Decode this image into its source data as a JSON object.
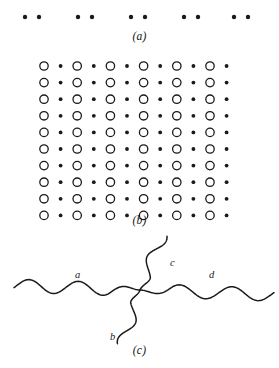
{
  "figure": {
    "width": 279,
    "height": 368,
    "background": "#ffffff",
    "ink_color": "#1a1a1a"
  },
  "panels": [
    {
      "id": "a",
      "caption": "(a)",
      "description": "row of dot pairs",
      "dot_color": "#1a1a1a",
      "dot_radius": 2.2,
      "baseline_y": 17,
      "pair_gap": 14,
      "pairs_x": [
        32,
        85,
        138,
        191,
        241
      ]
    },
    {
      "id": "b",
      "caption": "(b)",
      "description": "two-dimensional alternating lattice of open circles and filled dots",
      "rows": 10,
      "columns": 12,
      "open_circle_radius": 4.2,
      "open_circle_stroke": 1.3,
      "filled_dot_radius": 1.9,
      "origin_x": 44,
      "origin_y": 16,
      "step_x": 16.6,
      "step_y": 16.6,
      "circle_color": "#1a1a1a",
      "dot_color": "#1a1a1a"
    },
    {
      "id": "c",
      "caption": "(c)",
      "description": "four wavy lines meeting at a single vertex",
      "vertex": {
        "x": 140,
        "y": 60
      },
      "stroke_color": "#1a1a1a",
      "stroke_width": 1.5,
      "branches": [
        {
          "name": "a",
          "label": "a",
          "label_x": 75,
          "label_y": 39,
          "direction": "left"
        },
        {
          "name": "b",
          "label": "b",
          "label_x": 110,
          "label_y": 101,
          "direction": "down-left"
        },
        {
          "name": "c",
          "label": "c",
          "label_x": 170,
          "label_y": 27,
          "direction": "up-right"
        },
        {
          "name": "d",
          "label": "d",
          "label_x": 209,
          "label_y": 39,
          "direction": "right"
        }
      ]
    }
  ]
}
